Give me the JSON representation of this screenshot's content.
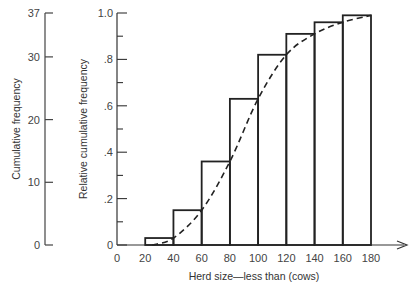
{
  "chart_data": {
    "type": "bar",
    "subtype": "cumulative histogram with smooth ogive curve",
    "title": "",
    "xlabel": "Herd size—less than (cows)",
    "ylabel": "Relative cumulative frequency",
    "ylabel_secondary": "Cumulative frequency",
    "xlim": [
      0,
      180
    ],
    "ylim": [
      0,
      1.0
    ],
    "ylim_secondary": [
      0,
      37
    ],
    "x_ticks": [
      "0",
      "20",
      "40",
      "60",
      "80",
      "100",
      "120",
      "140",
      "160",
      "180"
    ],
    "y_ticks": [
      "0",
      ".2",
      ".4",
      ".6",
      ".8",
      "1.0"
    ],
    "y_ticks_secondary": [
      "0",
      "10",
      "20",
      "30",
      "37"
    ],
    "bins": [
      [
        20,
        40
      ],
      [
        40,
        60
      ],
      [
        60,
        80
      ],
      [
        80,
        100
      ],
      [
        100,
        120
      ],
      [
        120,
        140
      ],
      [
        140,
        160
      ],
      [
        160,
        180
      ]
    ],
    "values": [
      0.03,
      0.15,
      0.36,
      0.63,
      0.82,
      0.91,
      0.96,
      0.99
    ],
    "curve": {
      "style": "dashed",
      "x": [
        25,
        40,
        60,
        80,
        100,
        120,
        140,
        160,
        180
      ],
      "y": [
        0.0,
        0.03,
        0.15,
        0.36,
        0.63,
        0.82,
        0.91,
        0.96,
        0.99
      ]
    },
    "grid": false,
    "legend": "none"
  }
}
